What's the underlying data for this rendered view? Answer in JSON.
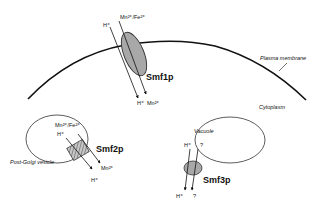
{
  "diagram": {
    "compartments": {
      "plasma_membrane": "Plasma membrane",
      "cytoplasm": "Cytoplasm",
      "post_golgi_vesicle": "Post-Golgi vesicle",
      "vacuole": "Vacuole"
    },
    "smf1p": {
      "name": "Smf1p",
      "in_left": "H⁺",
      "in_right": "Mn²⁺/Fe²⁺",
      "out_left": "H⁺",
      "out_right": "Mn²⁺"
    },
    "smf2p": {
      "name": "Smf2p",
      "in_top": "Mn²⁺/Fe²⁺",
      "in_left": "H⁺",
      "out_right": "Mn²⁺",
      "out_left": "H⁺"
    },
    "smf3p": {
      "name": "Smf3p",
      "in_left": "H⁺",
      "in_right": "?",
      "out_left": "H⁺",
      "out_right": "?"
    },
    "colors": {
      "line": "#111111",
      "transporter_fill": "#a8a8a8",
      "background": "#ffffff"
    }
  }
}
